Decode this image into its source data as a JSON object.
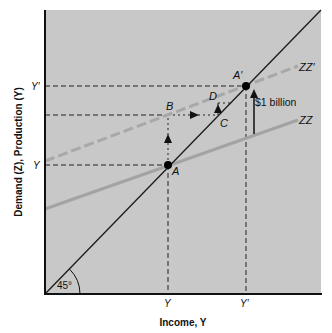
{
  "colors": {
    "plot_bg": "#c8c8c8",
    "axis": "#111111",
    "zz_line": "#a3a3a3",
    "zzp_line": "#a8a8a8",
    "diag_line": "#1a1a1a",
    "point": "#000000"
  },
  "axes": {
    "x_label": "Income, Y",
    "y_label": "Demand (Z), Production (Y)",
    "x_ticks": [
      {
        "label": "Y"
      },
      {
        "label": "Y′"
      }
    ],
    "y_ticks": [
      {
        "label": "Y′"
      },
      {
        "label": "Y"
      }
    ]
  },
  "lines": {
    "zz": {
      "label": "ZZ"
    },
    "zz_prime": {
      "label": "ZZ′"
    },
    "diagonal": {
      "angle_label": "45°"
    }
  },
  "points": {
    "A": {
      "label": "A"
    },
    "A_prime": {
      "label": "A′"
    },
    "B": {
      "label": "B"
    },
    "C": {
      "label": "C"
    },
    "D": {
      "label": "D"
    }
  },
  "annotation": {
    "shift_label": "$1 billion"
  }
}
